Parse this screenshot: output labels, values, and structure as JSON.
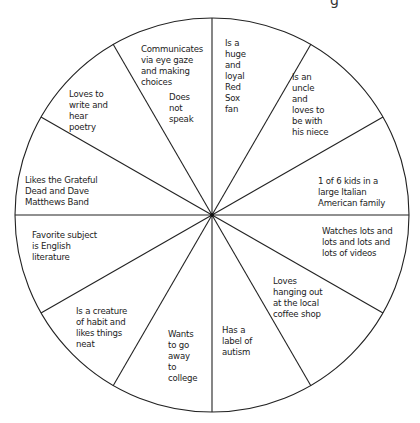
{
  "diagram": {
    "type": "circle-of-facts wheel",
    "slices": 12,
    "corner_fragment": "g",
    "slices_text": [
      {
        "id": "communicates",
        "text": "Communicates\nvia eye gaze\nand making\nchoices"
      },
      {
        "id": "does-not-speak",
        "text": "Does\nnot\nspeak"
      },
      {
        "id": "red-sox",
        "text": "Is a\nhuge\nand\nloyal\nRed\nSox\nfan"
      },
      {
        "id": "uncle",
        "text": "Is an\nuncle\nand\nloves to\nbe with\nhis niece"
      },
      {
        "id": "italian-family",
        "text": "1 of 6 kids in a\nlarge Italian\nAmerican family"
      },
      {
        "id": "videos",
        "text": "Watches lots and\nlots and lots and\nlots of videos"
      },
      {
        "id": "coffee-shop",
        "text": "Loves\nhanging out\nat the local\ncoffee shop"
      },
      {
        "id": "autism",
        "text": "Has a\nlabel of\nautism"
      },
      {
        "id": "college",
        "text": "Wants\nto go\naway\nto\ncollege"
      },
      {
        "id": "habit",
        "text": "Is a creature\nof habit and\nlikes things\nneat"
      },
      {
        "id": "english",
        "text": "Favorite subject\nis English\nliterature"
      },
      {
        "id": "grateful-dead",
        "text": "Likes the Grateful\nDead and Dave\nMatthews Band"
      },
      {
        "id": "poetry",
        "text": "Loves to\nwrite and\nhear\npoetry"
      }
    ]
  }
}
